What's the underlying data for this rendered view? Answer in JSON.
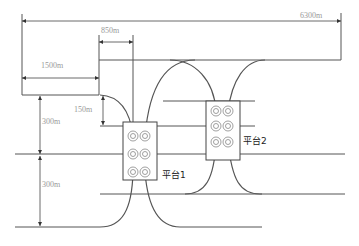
{
  "diagram": {
    "type": "well-platform layout",
    "dimensions": {
      "total_width": "6300m",
      "offset_850": "850m",
      "offset_1500": "1500m",
      "vertical_150": "150m",
      "vertical_300_top": "300m",
      "vertical_300_bottom": "300m"
    },
    "platforms": [
      {
        "label": "平台1",
        "wells": 6
      },
      {
        "label": "平台2",
        "wells": 6
      }
    ],
    "colors": {
      "line": "#555555",
      "label": "#999999",
      "platform_text": "#222222"
    }
  }
}
